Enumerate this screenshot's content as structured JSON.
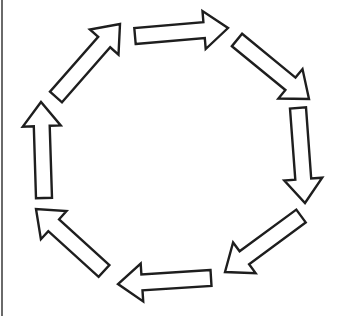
{
  "diagram": {
    "type": "cycle",
    "direction": "clockwise",
    "colors": {
      "stroke": "#1e1e1e",
      "fill": "#ffffff",
      "background": "#ffffff",
      "left_border": "#6a6a6a"
    },
    "arrows": [
      {
        "id": "arrow-top",
        "points_to": "right",
        "from": [
          135,
          36
        ],
        "to": [
          228,
          28
        ]
      },
      {
        "id": "arrow-top-right",
        "points_to": "down-right",
        "from": [
          237,
          40
        ],
        "to": [
          309,
          99
        ]
      },
      {
        "id": "arrow-right",
        "points_to": "down",
        "from": [
          298,
          108
        ],
        "to": [
          305,
          203
        ]
      },
      {
        "id": "arrow-bottom-right",
        "points_to": "down-left",
        "from": [
          301,
          216
        ],
        "to": [
          225,
          272
        ]
      },
      {
        "id": "arrow-bottom",
        "points_to": "left",
        "from": [
          211,
          278
        ],
        "to": [
          118,
          284
        ]
      },
      {
        "id": "arrow-bottom-left",
        "points_to": "up-left",
        "from": [
          104,
          271
        ],
        "to": [
          36,
          209
        ]
      },
      {
        "id": "arrow-left",
        "points_to": "up",
        "from": [
          44,
          198
        ],
        "to": [
          41,
          102
        ]
      },
      {
        "id": "arrow-top-left",
        "points_to": "up-right",
        "from": [
          56,
          97
        ],
        "to": [
          120,
          24
        ]
      }
    ]
  }
}
